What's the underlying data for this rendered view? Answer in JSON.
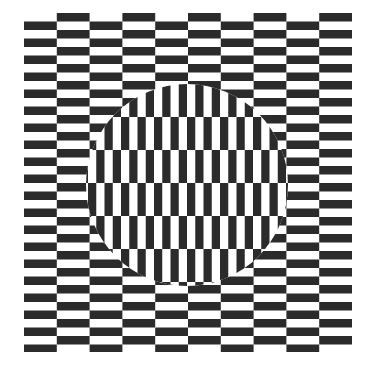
{
  "figure": {
    "type": "ouchi-illusion",
    "width": 370,
    "height": 370,
    "colors": {
      "ink": "#2b2b2b",
      "paper": "#ffffff"
    },
    "background": {
      "orientation": "horizontal-bricks",
      "x": 24,
      "y": 13,
      "width": 328,
      "height": 339,
      "brick_width": 32.8,
      "brick_height": 8.5,
      "row_period": 17,
      "column_offset": 8.5
    },
    "disc": {
      "orientation": "vertical-bricks",
      "cx": 187,
      "cy": 185,
      "r": 101,
      "brick_width": 8.25,
      "brick_height": 33,
      "column_period": 16.5,
      "row_offset": 8.25,
      "origin_x": 88,
      "origin_y": 84
    }
  }
}
